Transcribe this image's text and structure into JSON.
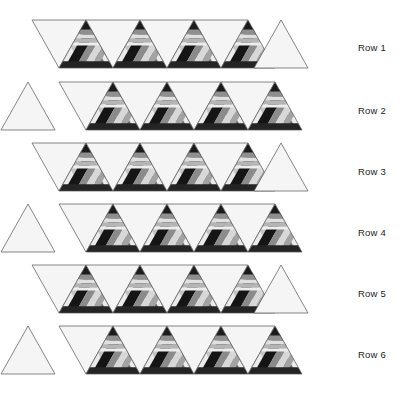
{
  "figure": {
    "title": "",
    "background_color": "#ffffff",
    "stroke_color": "#555555",
    "stroke_width": 0.7
  },
  "palette": {
    "blank": "#f5f5f5",
    "near_black": "#141414",
    "dark": "#2e2e2e",
    "dark_gray": "#4a4a4a",
    "mid_gray": "#7d7d7d",
    "gray": "#9a9a9a",
    "light_gray": "#bcbcbc",
    "lighter": "#d6d6d6",
    "lightest": "#ebebeb",
    "white": "#fafafa"
  },
  "geometry": {
    "triangle_width": 54,
    "triangle_height": 48,
    "rows": 6,
    "strip_left_even": 32,
    "strip_left_odd": 59,
    "detached_gap": 4
  },
  "rows": [
    {
      "label": "Row 1",
      "label_x": 358,
      "label_y": 42,
      "strip_y": 20,
      "strip_left": 32,
      "lead_orientation": "down",
      "detached_side": "right",
      "detached_orientation": "up",
      "units": 8,
      "patterned_indices": [
        1,
        3,
        5,
        7
      ]
    },
    {
      "label": "Row 2",
      "label_x": 358,
      "label_y": 105,
      "strip_y": 82,
      "strip_left": 59,
      "lead_orientation": "down",
      "detached_side": "left",
      "detached_orientation": "up",
      "units": 8,
      "patterned_indices": [
        1,
        3,
        5,
        7
      ]
    },
    {
      "label": "Row 3",
      "label_x": 358,
      "label_y": 166,
      "strip_y": 143,
      "strip_left": 32,
      "lead_orientation": "down",
      "detached_side": "right",
      "detached_orientation": "up",
      "units": 8,
      "patterned_indices": [
        1,
        3,
        5,
        7
      ]
    },
    {
      "label": "Row 4",
      "label_x": 358,
      "label_y": 227,
      "strip_y": 204,
      "strip_left": 59,
      "lead_orientation": "down",
      "detached_side": "left",
      "detached_orientation": "up",
      "units": 8,
      "patterned_indices": [
        1,
        3,
        5,
        7
      ]
    },
    {
      "label": "Row 5",
      "label_x": 358,
      "label_y": 288,
      "strip_y": 265,
      "strip_left": 32,
      "lead_orientation": "down",
      "detached_side": "right",
      "detached_orientation": "up",
      "units": 8,
      "patterned_indices": [
        1,
        3,
        5,
        7
      ]
    },
    {
      "label": "Row 6",
      "label_x": 358,
      "label_y": 349,
      "strip_y": 326,
      "strip_left": 59,
      "lead_orientation": "down",
      "detached_side": "left",
      "detached_orientation": "up",
      "units": 8,
      "patterned_indices": [
        1,
        3,
        5,
        7
      ]
    }
  ],
  "pattern": {
    "name": "banded-triangle-motif",
    "bands": [
      {
        "id": "apex",
        "color": "#1b1b1b",
        "kind": "apex"
      },
      {
        "id": "b1",
        "color": "#8f8f8f",
        "kind": "horizontal",
        "y0": 0.18,
        "y1": 0.3
      },
      {
        "id": "b2",
        "color": "#e0e0e0",
        "kind": "horizontal",
        "y0": 0.3,
        "y1": 0.38
      },
      {
        "id": "b3",
        "color": "#b5b5b5",
        "kind": "horizontal",
        "y0": 0.38,
        "y1": 0.47
      },
      {
        "id": "b4",
        "color": "#ededed",
        "kind": "horizontal",
        "y0": 0.47,
        "y1": 0.53
      },
      {
        "id": "d1",
        "color": "#151515",
        "kind": "diagonal-left",
        "t0": 0.1,
        "t1": 0.3
      },
      {
        "id": "d2",
        "color": "#8b8b8b",
        "kind": "diagonal-left",
        "t0": 0.3,
        "t1": 0.44
      },
      {
        "id": "d3",
        "color": "#d8d8d8",
        "kind": "diagonal-left",
        "t0": 0.44,
        "t1": 0.58
      },
      {
        "id": "d4",
        "color": "#a3a3a3",
        "kind": "diagonal-left",
        "t0": 0.58,
        "t1": 0.7
      },
      {
        "id": "e1",
        "color": "#6f6f6f",
        "kind": "diagonal-right",
        "t0": 0.1,
        "t1": 0.26
      },
      {
        "id": "e2",
        "color": "#efefef",
        "kind": "diagonal-right",
        "t0": 0.26,
        "t1": 0.42
      },
      {
        "id": "e3",
        "color": "#c4c4c4",
        "kind": "diagonal-right",
        "t0": 0.42,
        "t1": 0.56
      },
      {
        "id": "base",
        "color": "#242424",
        "kind": "base-band",
        "y0": 0.86,
        "y1": 1.0
      }
    ]
  }
}
